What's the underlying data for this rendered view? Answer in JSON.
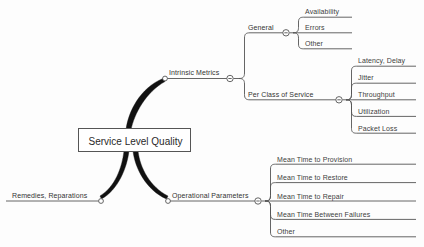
{
  "diagram": {
    "type": "mind-map",
    "background_color": "#fdfdfd",
    "line_color": "#555555",
    "text_color": "#3a3a3a",
    "center": {
      "label": "Service Level Quality"
    },
    "branches": [
      {
        "id": "intrinsic-metrics",
        "label": "Intrinsic Metrics",
        "side": "right",
        "collapse_glyph": "-",
        "children": [
          {
            "id": "general",
            "label": "General",
            "collapse_glyph": "-",
            "children": [
              {
                "label": "Availability"
              },
              {
                "label": "Errors"
              },
              {
                "label": "Other"
              }
            ]
          },
          {
            "id": "per-class-of-service",
            "label": "Per Class of Service",
            "collapse_glyph": "-",
            "children": [
              {
                "label": "Latency, Delay"
              },
              {
                "label": "Jitter"
              },
              {
                "label": "Throughput"
              },
              {
                "label": "Utilization"
              },
              {
                "label": "Packet Loss"
              }
            ]
          }
        ]
      },
      {
        "id": "operational-parameters",
        "label": "Operational Parameters",
        "side": "right",
        "collapse_glyph": "-",
        "children": [
          {
            "label": "Mean Time to Provision"
          },
          {
            "label": "Mean Time to Restore"
          },
          {
            "label": "Mean Time to Repair"
          },
          {
            "label": "Mean Time Between Failures"
          },
          {
            "label": "Other"
          }
        ]
      },
      {
        "id": "remedies-reparations",
        "label": "Remedies, Reparations",
        "side": "left",
        "children": []
      }
    ]
  }
}
